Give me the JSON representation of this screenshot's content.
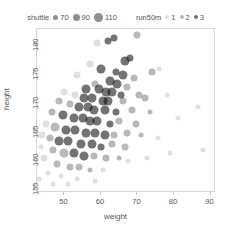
{
  "legends": {
    "size_legend": {
      "title": "shuttle",
      "name": "shuttle",
      "entries": [
        {
          "label": "70",
          "size_px": 5.0
        },
        {
          "label": "90",
          "size_px": 7.0
        },
        {
          "label": "110",
          "size_px": 9.0
        }
      ]
    },
    "alpha_legend": {
      "title": "run50m",
      "name": "run50m",
      "entries": [
        {
          "label": "1",
          "opacity": 0.12
        },
        {
          "label": "2",
          "opacity": 0.28
        },
        {
          "label": "3",
          "opacity": 0.55
        }
      ]
    }
  },
  "axes": {
    "x": {
      "label": "weight",
      "ticks": [
        "50",
        "60",
        "70",
        "80",
        "90"
      ],
      "tick_values": [
        50,
        60,
        70,
        80,
        90
      ],
      "min": 42.5,
      "max": 91.5
    },
    "y": {
      "label": "height",
      "ticks": [
        "155",
        "160",
        "165",
        "170",
        "175",
        "180"
      ],
      "tick_values": [
        155,
        160,
        165,
        170,
        175,
        180
      ],
      "min": 154.0,
      "max": 182.5
    }
  },
  "colors": {
    "point": "#000000",
    "frame": "#d6d6d6",
    "text": "#555555",
    "background": "#ffffff"
  },
  "chart_data": {
    "type": "scatter",
    "title": "",
    "xlabel": "weight",
    "ylabel": "height",
    "xlim": [
      42.5,
      91.5
    ],
    "ylim": [
      154.0,
      182.5
    ],
    "grid": false,
    "legend_position": "top",
    "size_encoding": {
      "field": "shuttle",
      "values": [
        70,
        90,
        110
      ],
      "radius_px": [
        5,
        7,
        9
      ]
    },
    "alpha_encoding": {
      "field": "run50m",
      "values": [
        1,
        2,
        3
      ],
      "opacity": [
        0.12,
        0.28,
        0.55
      ]
    },
    "series": [
      {
        "name": "students",
        "fields": [
          "weight",
          "height",
          "shuttle",
          "run50m"
        ],
        "points": [
          [
            63.5,
            181.0,
            90,
            3
          ],
          [
            70.0,
            181.5,
            90,
            2
          ],
          [
            59.0,
            180.0,
            90,
            1
          ],
          [
            62.0,
            180.5,
            90,
            3
          ],
          [
            66.5,
            177.0,
            110,
            3
          ],
          [
            68.0,
            177.5,
            90,
            3
          ],
          [
            57.0,
            176.5,
            90,
            1
          ],
          [
            74.0,
            175.0,
            90,
            2
          ],
          [
            60.0,
            175.5,
            110,
            3
          ],
          [
            64.0,
            175.0,
            90,
            3
          ],
          [
            66.0,
            174.5,
            110,
            3
          ],
          [
            69.0,
            174.0,
            90,
            2
          ],
          [
            53.5,
            174.5,
            90,
            1
          ],
          [
            58.5,
            173.0,
            90,
            2
          ],
          [
            62.5,
            173.5,
            110,
            3
          ],
          [
            64.5,
            173.0,
            110,
            3
          ],
          [
            67.0,
            172.5,
            90,
            2
          ],
          [
            56.0,
            172.0,
            110,
            3
          ],
          [
            59.5,
            172.0,
            110,
            3
          ],
          [
            61.5,
            171.5,
            110,
            3
          ],
          [
            63.0,
            171.5,
            110,
            3
          ],
          [
            65.5,
            171.0,
            90,
            3
          ],
          [
            70.5,
            171.0,
            90,
            2
          ],
          [
            50.0,
            171.5,
            90,
            1
          ],
          [
            53.0,
            171.0,
            90,
            1
          ],
          [
            55.5,
            170.5,
            110,
            3
          ],
          [
            57.5,
            170.5,
            110,
            3
          ],
          [
            60.5,
            170.0,
            110,
            3
          ],
          [
            62.0,
            170.0,
            110,
            3
          ],
          [
            66.0,
            170.0,
            90,
            2
          ],
          [
            72.0,
            170.5,
            90,
            2
          ],
          [
            78.0,
            171.0,
            70,
            1
          ],
          [
            48.5,
            170.0,
            90,
            2
          ],
          [
            51.5,
            169.5,
            90,
            2
          ],
          [
            54.0,
            169.0,
            110,
            3
          ],
          [
            56.5,
            169.0,
            110,
            3
          ],
          [
            58.0,
            168.5,
            110,
            3
          ],
          [
            61.0,
            168.5,
            110,
            3
          ],
          [
            64.0,
            168.0,
            90,
            3
          ],
          [
            68.5,
            168.5,
            90,
            2
          ],
          [
            73.5,
            168.0,
            70,
            2
          ],
          [
            46.5,
            168.0,
            90,
            2
          ],
          [
            49.5,
            167.5,
            110,
            3
          ],
          [
            52.5,
            167.0,
            110,
            3
          ],
          [
            55.0,
            167.0,
            110,
            3
          ],
          [
            57.0,
            166.5,
            110,
            3
          ],
          [
            59.0,
            166.5,
            110,
            3
          ],
          [
            62.5,
            166.0,
            90,
            3
          ],
          [
            65.0,
            166.5,
            90,
            2
          ],
          [
            69.5,
            166.0,
            90,
            2
          ],
          [
            45.0,
            166.0,
            90,
            1
          ],
          [
            47.5,
            165.5,
            110,
            2
          ],
          [
            50.5,
            165.0,
            110,
            3
          ],
          [
            53.0,
            165.0,
            110,
            3
          ],
          [
            56.0,
            164.5,
            110,
            3
          ],
          [
            58.5,
            164.5,
            110,
            3
          ],
          [
            61.0,
            164.0,
            110,
            3
          ],
          [
            63.5,
            164.0,
            90,
            2
          ],
          [
            67.0,
            164.5,
            90,
            2
          ],
          [
            71.0,
            164.0,
            70,
            2
          ],
          [
            44.0,
            164.0,
            90,
            1
          ],
          [
            46.0,
            163.5,
            90,
            2
          ],
          [
            48.5,
            163.0,
            110,
            3
          ],
          [
            51.0,
            163.0,
            110,
            3
          ],
          [
            54.5,
            162.5,
            110,
            3
          ],
          [
            57.5,
            162.5,
            110,
            3
          ],
          [
            60.0,
            162.0,
            90,
            3
          ],
          [
            63.0,
            162.5,
            90,
            2
          ],
          [
            66.5,
            162.0,
            90,
            2
          ],
          [
            43.5,
            162.0,
            70,
            1
          ],
          [
            47.0,
            161.5,
            90,
            2
          ],
          [
            50.0,
            161.0,
            110,
            2
          ],
          [
            52.5,
            161.0,
            110,
            3
          ],
          [
            55.5,
            160.5,
            110,
            3
          ],
          [
            58.0,
            160.5,
            90,
            2
          ],
          [
            61.5,
            160.0,
            90,
            2
          ],
          [
            65.0,
            160.0,
            70,
            2
          ],
          [
            44.5,
            160.0,
            90,
            1
          ],
          [
            48.0,
            159.0,
            90,
            2
          ],
          [
            51.5,
            158.5,
            90,
            2
          ],
          [
            54.0,
            158.5,
            90,
            2
          ],
          [
            57.0,
            158.0,
            70,
            2
          ],
          [
            60.5,
            158.0,
            70,
            1
          ],
          [
            45.5,
            157.5,
            70,
            1
          ],
          [
            49.0,
            157.0,
            70,
            1
          ],
          [
            53.5,
            156.5,
            70,
            1
          ],
          [
            58.5,
            156.0,
            70,
            1
          ],
          [
            43.0,
            156.5,
            70,
            1
          ],
          [
            47.0,
            155.5,
            70,
            1
          ],
          [
            51.0,
            155.5,
            70,
            1
          ],
          [
            86.5,
            169.0,
            70,
            1
          ],
          [
            88.0,
            161.5,
            70,
            1
          ],
          [
            76.0,
            175.5,
            70,
            1
          ],
          [
            81.0,
            167.0,
            70,
            1
          ],
          [
            75.5,
            163.5,
            70,
            1
          ],
          [
            79.0,
            161.0,
            70,
            1
          ],
          [
            72.5,
            160.0,
            70,
            1
          ],
          [
            67.5,
            159.5,
            70,
            1
          ]
        ]
      }
    ]
  }
}
